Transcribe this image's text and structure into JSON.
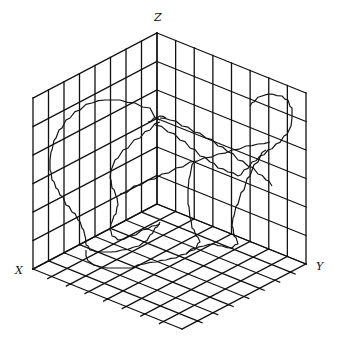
{
  "figure": {
    "type": "3d-box-plot",
    "axis_labels": {
      "x": "X",
      "y": "Y",
      "z": "Z"
    },
    "label_positions": {
      "x": {
        "left": 15,
        "top": 265
      },
      "y": {
        "left": 316,
        "top": 261
      },
      "z": {
        "left": 154,
        "top": 12
      }
    },
    "colors": {
      "line": "#111111",
      "background": "#ffffff"
    }
  },
  "chart_data": {
    "type": "3d-line",
    "title": "",
    "axes": {
      "xlabel": "X",
      "ylabel": "Y",
      "zlabel": "Z"
    },
    "grid": {
      "x_divisions": 8,
      "y_divisions": 8,
      "z_divisions": 6,
      "show_grid": true,
      "walls": [
        "xz-back",
        "yz-back",
        "xy-floor"
      ]
    },
    "projection": {
      "origin": [
        157,
        204
      ],
      "x_axis_end": [
        33,
        269
      ],
      "y_axis_end": [
        306,
        264
      ],
      "z_axis_end": [
        157,
        33
      ]
    },
    "floor_tick_marks": true,
    "curves": [
      {
        "name": "left-loop",
        "points": [
          [
            160,
            120
          ],
          [
            150,
            108
          ],
          [
            135,
            103
          ],
          [
            120,
            100
          ],
          [
            105,
            100
          ],
          [
            92,
            103
          ],
          [
            80,
            110
          ],
          [
            70,
            118
          ],
          [
            62,
            128
          ],
          [
            56,
            138
          ],
          [
            52,
            150
          ],
          [
            50,
            160
          ],
          [
            50,
            170
          ],
          [
            52,
            180
          ],
          [
            56,
            188
          ],
          [
            60,
            195
          ],
          [
            66,
            205
          ],
          [
            72,
            212
          ],
          [
            78,
            220
          ],
          [
            82,
            228
          ],
          [
            85,
            236
          ],
          [
            86,
            245
          ],
          [
            90,
            250
          ],
          [
            96,
            252
          ],
          [
            110,
            252
          ],
          [
            122,
            250
          ],
          [
            134,
            247
          ],
          [
            144,
            242
          ],
          [
            150,
            235
          ],
          [
            155,
            228
          ],
          [
            160,
            222
          ]
        ]
      },
      {
        "name": "inner-left-loop",
        "points": [
          [
            160,
            122
          ],
          [
            150,
            130
          ],
          [
            140,
            138
          ],
          [
            128,
            148
          ],
          [
            118,
            158
          ],
          [
            112,
            168
          ],
          [
            110,
            178
          ],
          [
            112,
            188
          ],
          [
            116,
            196
          ],
          [
            118,
            205
          ],
          [
            116,
            214
          ],
          [
            112,
            222
          ],
          [
            110,
            230
          ],
          [
            112,
            236
          ],
          [
            118,
            240
          ],
          [
            130,
            236
          ],
          [
            142,
            230
          ],
          [
            152,
            226
          ],
          [
            160,
            224
          ]
        ]
      },
      {
        "name": "diagonal-upper",
        "points": [
          [
            160,
            118
          ],
          [
            170,
            120
          ],
          [
            182,
            126
          ],
          [
            194,
            132
          ],
          [
            206,
            138
          ],
          [
            218,
            146
          ],
          [
            228,
            152
          ],
          [
            238,
            160
          ],
          [
            248,
            166
          ],
          [
            258,
            174
          ],
          [
            266,
            180
          ],
          [
            272,
            186
          ]
        ]
      },
      {
        "name": "diagonal-lower",
        "points": [
          [
            155,
            125
          ],
          [
            168,
            132
          ],
          [
            180,
            140
          ],
          [
            190,
            148
          ],
          [
            200,
            156
          ],
          [
            210,
            162
          ],
          [
            218,
            168
          ],
          [
            228,
            172
          ],
          [
            238,
            176
          ]
        ]
      },
      {
        "name": "right-loop",
        "points": [
          [
            238,
            176
          ],
          [
            244,
            170
          ],
          [
            252,
            162
          ],
          [
            260,
            156
          ],
          [
            268,
            150
          ],
          [
            276,
            144
          ],
          [
            284,
            136
          ],
          [
            290,
            128
          ],
          [
            292,
            118
          ],
          [
            292,
            108
          ],
          [
            288,
            100
          ],
          [
            282,
            96
          ],
          [
            272,
            94
          ],
          [
            262,
            96
          ],
          [
            254,
            102
          ],
          [
            250,
            106
          ]
        ]
      },
      {
        "name": "crossing-line",
        "points": [
          [
            120,
            194
          ],
          [
            134,
            186
          ],
          [
            148,
            180
          ],
          [
            162,
            174
          ],
          [
            176,
            168
          ],
          [
            190,
            162
          ],
          [
            204,
            158
          ],
          [
            218,
            154
          ],
          [
            232,
            150
          ],
          [
            246,
            146
          ],
          [
            258,
            144
          ],
          [
            270,
            142
          ]
        ]
      },
      {
        "name": "right-descent",
        "points": [
          [
            266,
            150
          ],
          [
            258,
            162
          ],
          [
            250,
            176
          ],
          [
            244,
            190
          ],
          [
            238,
            204
          ],
          [
            234,
            216
          ],
          [
            232,
            226
          ],
          [
            234,
            236
          ],
          [
            238,
            244
          ],
          [
            232,
            248
          ],
          [
            222,
            246
          ],
          [
            214,
            244
          ],
          [
            204,
            246
          ],
          [
            194,
            250
          ],
          [
            186,
            254
          ],
          [
            176,
            258
          ]
        ]
      },
      {
        "name": "center-descent",
        "points": [
          [
            194,
            162
          ],
          [
            190,
            176
          ],
          [
            188,
            190
          ],
          [
            188,
            204
          ],
          [
            190,
            218
          ],
          [
            192,
            228
          ],
          [
            196,
            236
          ],
          [
            200,
            242
          ],
          [
            196,
            248
          ],
          [
            186,
            254
          ]
        ]
      },
      {
        "name": "floor-trace",
        "points": [
          [
            176,
            258
          ],
          [
            166,
            260
          ],
          [
            156,
            262
          ],
          [
            144,
            264
          ],
          [
            132,
            268
          ],
          [
            120,
            268
          ],
          [
            108,
            268
          ],
          [
            98,
            266
          ],
          [
            90,
            262
          ],
          [
            86,
            256
          ],
          [
            86,
            250
          ]
        ]
      },
      {
        "name": "top-wiggle",
        "points": [
          [
            148,
            122
          ],
          [
            154,
            118
          ],
          [
            160,
            116
          ],
          [
            166,
            118
          ]
        ]
      }
    ]
  }
}
